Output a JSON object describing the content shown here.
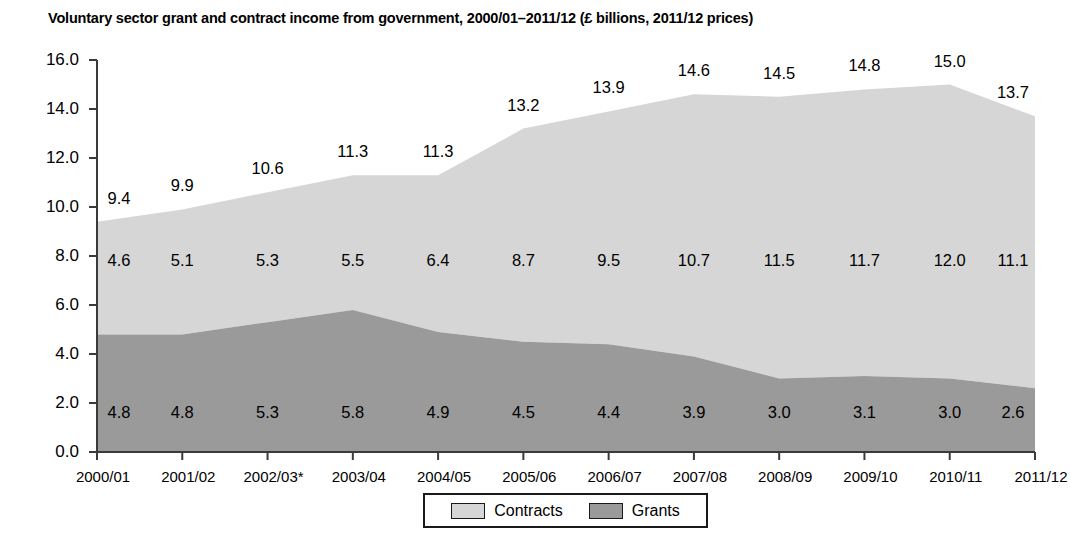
{
  "chart_data": {
    "type": "area",
    "stacked": true,
    "title": "Voluntary sector grant and contract income from government, 2000/01–2011/12 (£ billions, 2011/12 prices)",
    "xlabel": "",
    "ylabel": "",
    "categories": [
      "2000/01",
      "2001/02",
      "2002/03*",
      "2003/04",
      "2004/05",
      "2005/06",
      "2006/07",
      "2007/08",
      "2008/09",
      "2009/10",
      "2010/11",
      "2011/12"
    ],
    "series": [
      {
        "name": "Grants",
        "color": "#9a9a9a",
        "values": [
          4.8,
          4.8,
          5.3,
          5.8,
          4.9,
          4.5,
          4.4,
          3.9,
          3.0,
          3.1,
          3.0,
          2.6
        ]
      },
      {
        "name": "Contracts",
        "color": "#d6d6d6",
        "values": [
          4.6,
          5.1,
          5.3,
          5.5,
          6.4,
          8.7,
          9.5,
          10.7,
          11.5,
          11.7,
          12.0,
          11.1
        ]
      }
    ],
    "totals": [
      9.4,
      9.9,
      10.6,
      11.3,
      11.3,
      13.2,
      13.9,
      14.6,
      14.5,
      14.8,
      15.0,
      13.7
    ],
    "ylim": [
      0.0,
      16.0
    ],
    "yticks": [
      "0.0",
      "2.0",
      "4.0",
      "6.0",
      "8.0",
      "10.0",
      "12.0",
      "14.0",
      "16.0"
    ],
    "ytick_values": [
      0.0,
      2.0,
      4.0,
      6.0,
      8.0,
      10.0,
      12.0,
      14.0,
      16.0
    ],
    "grid": false,
    "legend_position": "bottom",
    "legend": [
      {
        "label": "Contracts",
        "color": "#d6d6d6"
      },
      {
        "label": "Grants",
        "color": "#9a9a9a"
      }
    ],
    "axis_color": "#3a3a3a"
  }
}
